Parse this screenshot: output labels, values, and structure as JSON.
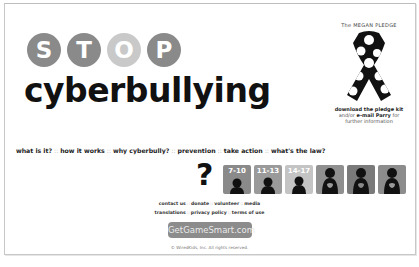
{
  "logo": {
    "letters": [
      "S",
      "T",
      "O",
      "P"
    ],
    "wordmark": "cyberbullying"
  },
  "pledge": {
    "title": "The MEGAN PLEDGE",
    "download_link": "download the pledge kit",
    "more_prefix": "and/or ",
    "email_link": "e-mail Parry",
    "more_suffix": " for further information"
  },
  "nav": {
    "items": [
      {
        "label": "what is it?"
      },
      {
        "label": "how it works"
      },
      {
        "label": "why cyberbully?"
      },
      {
        "label": "prevention"
      },
      {
        "label": "take action"
      },
      {
        "label": "what's the law?"
      }
    ],
    "separator": "::"
  },
  "audience": {
    "help_symbol": "?",
    "tiles": [
      {
        "label": "7-10",
        "color": "#8a8a8a"
      },
      {
        "label": "11-13",
        "color": "#9a9a9a"
      },
      {
        "label": "14-17",
        "color": "#c4c4c4"
      },
      {
        "label": "",
        "color": "#8f8f8f"
      },
      {
        "label": "",
        "color": "#7a7a7a"
      },
      {
        "label": "",
        "color": "#8c8c8c"
      }
    ]
  },
  "footer": {
    "row1": [
      "contact us",
      "donate",
      "volunteer",
      "media"
    ],
    "row2": [
      "translations",
      "privacy policy",
      "terms of use"
    ],
    "separator": "::",
    "badge": "GetGameSmart.com",
    "copyright": "© WiredKids, Inc. All rights reserved."
  }
}
